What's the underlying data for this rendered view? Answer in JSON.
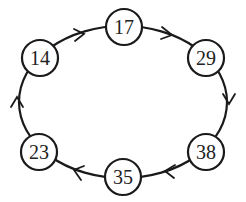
{
  "diagram": {
    "type": "circular-linked-list",
    "direction": "clockwise",
    "nodes": [
      {
        "id": "n17",
        "label": "17",
        "x": 124,
        "y": 27
      },
      {
        "id": "n29",
        "label": "29",
        "x": 206,
        "y": 58
      },
      {
        "id": "n38",
        "label": "38",
        "x": 206,
        "y": 152
      },
      {
        "id": "n35",
        "label": "35",
        "x": 123,
        "y": 177
      },
      {
        "id": "n23",
        "label": "23",
        "x": 39,
        "y": 152
      },
      {
        "id": "n14",
        "label": "14",
        "x": 40,
        "y": 58
      }
    ],
    "edges": [
      {
        "from": "17",
        "to": "29"
      },
      {
        "from": "29",
        "to": "38"
      },
      {
        "from": "38",
        "to": "35"
      },
      {
        "from": "35",
        "to": "23"
      },
      {
        "from": "23",
        "to": "14"
      },
      {
        "from": "14",
        "to": "17"
      }
    ],
    "colors": {
      "stroke": "#1a1a1a",
      "fill": "#ffffff",
      "text": "#222222"
    }
  }
}
